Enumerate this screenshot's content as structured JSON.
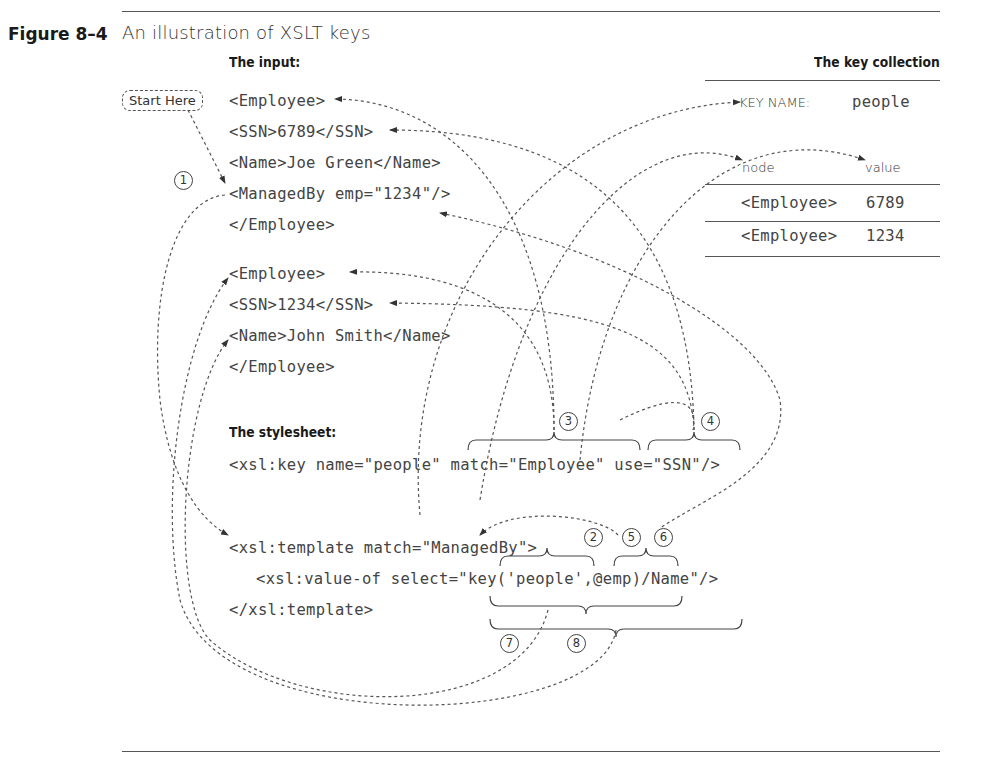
{
  "figure": {
    "label": "Figure 8–4",
    "title": "An illustration of XSLT keys"
  },
  "input_section": {
    "heading": "The input:",
    "start_here": "Start Here",
    "lines": [
      "<Employee>",
      "<SSN>6789</SSN>",
      "<Name>Joe Green</Name>",
      "<ManagedBy emp=\"1234\"/>",
      "</Employee>",
      "<Employee>",
      "<SSN>1234</SSN>",
      "<Name>John Smith</Name>",
      "</Employee>"
    ]
  },
  "key_collection": {
    "heading": "The key collection",
    "key_name_label": "KEY NAME:",
    "key_name_value": "people",
    "columns": [
      "node",
      "value"
    ],
    "rows": [
      {
        "node": "<Employee>",
        "value": "6789"
      },
      {
        "node": "<Employee>",
        "value": "1234"
      }
    ]
  },
  "stylesheet_section": {
    "heading": "The stylesheet:",
    "key_decl": {
      "prefix": "<xsl:key name=\"people\" ",
      "match": "match=\"Employee\"",
      "use": "use=\"SSN\"/>"
    },
    "template_open": "<xsl:template match=\"ManagedBy\">",
    "value_of": "<xsl:value-of select=\"key('people',@emp)/Name\"/>",
    "template_close": "</xsl:template>"
  },
  "steps": [
    "1",
    "2",
    "3",
    "4",
    "5",
    "6",
    "7",
    "8"
  ],
  "colors": {
    "ink": "#2a2a2a",
    "rule": "#555555",
    "dash": "#444444"
  }
}
